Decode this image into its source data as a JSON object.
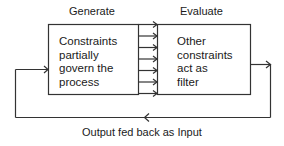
{
  "diagram": {
    "stages": [
      {
        "title": "Generate",
        "body_lines": [
          "Constraints",
          "partially",
          "govern the",
          "process"
        ]
      },
      {
        "title": "Evaluate",
        "body_lines": [
          "Other",
          "constraints",
          "act as",
          "filter"
        ]
      }
    ],
    "connector_arrow_count": 6,
    "feedback_label": "Output fed back as Input",
    "colors": {
      "line": "#333333",
      "text": "#1a1a1a",
      "background": "#ffffff"
    }
  }
}
